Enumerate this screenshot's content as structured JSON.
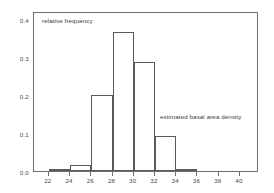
{
  "chart_data": {
    "type": "bar",
    "title": "",
    "subtitle": "",
    "xlabel": "estimated basal area density",
    "ylabel": "relative frequency",
    "xlim": [
      20.6,
      41.8
    ],
    "ylim": [
      0.0,
      0.42
    ],
    "grid": false,
    "legend": null,
    "bin_width": 2,
    "bins": [
      {
        "x0": 22,
        "x1": 24,
        "value": 0.005
      },
      {
        "x0": 24,
        "x1": 26,
        "value": 0.016
      },
      {
        "x0": 26,
        "x1": 28,
        "value": 0.2
      },
      {
        "x0": 28,
        "x1": 30,
        "value": 0.366
      },
      {
        "x0": 30,
        "x1": 32,
        "value": 0.285
      },
      {
        "x0": 32,
        "x1": 34,
        "value": 0.093
      },
      {
        "x0": 34,
        "x1": 36,
        "value": 0.006
      }
    ],
    "categories": [
      "22-24",
      "24-26",
      "26-28",
      "28-30",
      "30-32",
      "32-34",
      "34-36"
    ],
    "values": [
      0.005,
      0.016,
      0.2,
      0.366,
      0.285,
      0.093,
      0.006
    ],
    "xticks": [
      22,
      24,
      26,
      28,
      30,
      32,
      34,
      36,
      38,
      40
    ],
    "xtick_labels": [
      "22",
      "24",
      "26",
      "28",
      "30",
      "32",
      "34",
      "36",
      "38",
      "40"
    ],
    "yticks": [
      0.0,
      0.1,
      0.2,
      0.3,
      0.4
    ],
    "ytick_labels": [
      "0.0",
      "0.1",
      "0.2",
      "0.3",
      "0.4"
    ],
    "annotations": [
      {
        "text": "relative frequency",
        "x": 21.6,
        "y": 0.405
      },
      {
        "text": "estimated basal area density",
        "x": 32.6,
        "y": 0.155
      }
    ],
    "colors": {
      "bar_fill": "#ffffff",
      "bar_edge": "#5a5a5a",
      "frame": "#6e6e6e",
      "text": "#4a4a4a",
      "background": "#ffffff"
    }
  }
}
